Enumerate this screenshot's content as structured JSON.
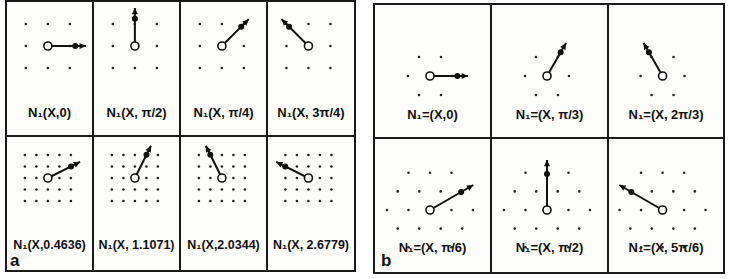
{
  "figure": {
    "panels": [
      {
        "id": "a",
        "letter": "a",
        "rows": 2,
        "cols": 4,
        "cells": [
          {
            "label": "N₁(X,0)",
            "angle_rad": 0,
            "lattice": "square-3x3"
          },
          {
            "label": "N₁(X, π/2)",
            "angle_rad": 1.5708,
            "lattice": "square-3x3"
          },
          {
            "label": "N₁(X, π/4)",
            "angle_rad": 0.7854,
            "lattice": "square-3x3"
          },
          {
            "label": "N₁(X, 3π/4)",
            "angle_rad": 2.3562,
            "lattice": "square-3x3"
          },
          {
            "label": "N₁(X,0.4636)",
            "angle_rad": 0.4636,
            "lattice": "square-5x5"
          },
          {
            "label": "N₁(X, 1.1071)",
            "angle_rad": 1.1071,
            "lattice": "square-5x5"
          },
          {
            "label": "N₁(X,2.0344)",
            "angle_rad": 2.0344,
            "lattice": "square-5x5"
          },
          {
            "label": "N₁(X, 2.6779)",
            "angle_rad": 2.6779,
            "lattice": "square-5x5"
          }
        ]
      },
      {
        "id": "b",
        "letter": "b",
        "rows": 2,
        "cols": 3,
        "cells": [
          {
            "label": "N₁=(X,0)",
            "angle_rad": 0,
            "lattice": "hex-small"
          },
          {
            "label": "N₁=(X, π/3)",
            "angle_rad": 1.0472,
            "lattice": "hex-small"
          },
          {
            "label": "N₁=(X, 2π/3)",
            "angle_rad": 2.0944,
            "lattice": "hex-small"
          },
          {
            "label": "N₁=(X, π/6)",
            "angle_rad": 0.5236,
            "lattice": "hex-large"
          },
          {
            "label": "N₁=(X, π/2)",
            "angle_rad": 1.5708,
            "lattice": "hex-large"
          },
          {
            "label": "N₁=(X, 5π/6)",
            "angle_rad": 2.618,
            "lattice": "hex-large"
          }
        ]
      }
    ]
  }
}
